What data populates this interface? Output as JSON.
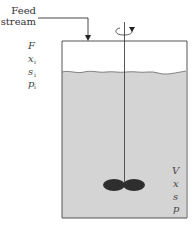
{
  "feed": {
    "label_line1": "Feed",
    "label_line2": "stream"
  },
  "inlet_variables": [
    {
      "symbol": "F",
      "subscript": ""
    },
    {
      "symbol": "x",
      "subscript": "i"
    },
    {
      "symbol": "s",
      "subscript": "i"
    },
    {
      "symbol": "p",
      "subscript": "i"
    }
  ],
  "reactor_variables": [
    {
      "symbol": "V"
    },
    {
      "symbol": "x"
    },
    {
      "symbol": "s"
    },
    {
      "symbol": "p"
    }
  ],
  "colors": {
    "liquid": "#d4d4d4",
    "outline": "#555555",
    "impeller": "#2e2e2e"
  }
}
